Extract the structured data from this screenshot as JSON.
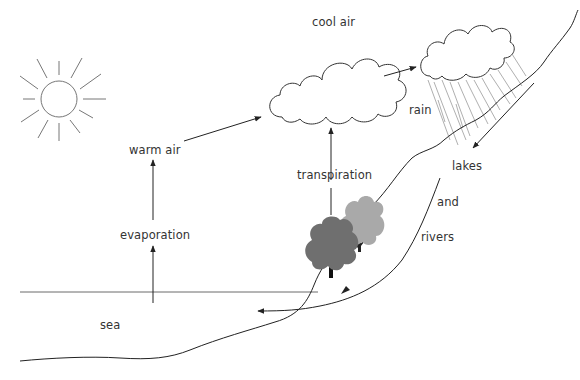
{
  "labels": {
    "cool_air": "cool air",
    "warm_air": "warm air",
    "evaporation": "evaporation",
    "transpiration": "transpiration",
    "rain": "rain",
    "lakes": "lakes",
    "and": "and",
    "rivers": "rivers",
    "sea": "sea"
  },
  "elements": {
    "sun": "sun-icon",
    "cloud_main": "cloud",
    "cloud_rain": "rain-cloud",
    "trees": [
      "tree-dark",
      "tree-light"
    ]
  },
  "colors": {
    "line": "#222222",
    "sun_stroke": "#777777",
    "rain_stroke": "#9a9a9a",
    "tree_dark": "#6f6f6f",
    "tree_light": "#a9a9a9",
    "text": "#333333"
  }
}
